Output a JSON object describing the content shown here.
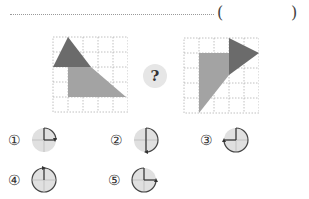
{
  "question": {
    "blank_open": "(",
    "blank_close": ")",
    "mystery": "?"
  },
  "figures": {
    "left": {
      "grid_cells": 5,
      "description": "shape before rotation"
    },
    "right": {
      "grid_cells": 5,
      "description": "shape after rotation"
    }
  },
  "colors": {
    "dark_shade": "#6b6b6b",
    "light_shade": "#a3a3a3",
    "dial_fill": "#e0e0e0"
  },
  "options": [
    {
      "label": "①",
      "rotation": "90° clockwise"
    },
    {
      "label": "②",
      "rotation": "180° clockwise"
    },
    {
      "label": "③",
      "rotation": "270° clockwise"
    },
    {
      "label": "④",
      "rotation": "360°"
    },
    {
      "label": "⑤",
      "rotation": "270° counterclockwise"
    }
  ]
}
